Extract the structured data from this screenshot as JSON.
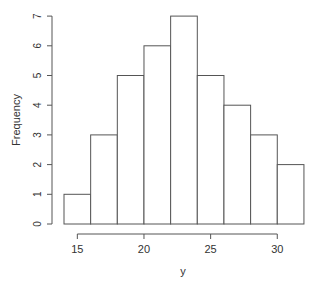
{
  "chart_data": {
    "type": "bar",
    "subtype": "histogram",
    "title": "",
    "xlabel": "y",
    "ylabel": "Frequency",
    "bins": [
      [
        14,
        16
      ],
      [
        16,
        18
      ],
      [
        18,
        20
      ],
      [
        20,
        22
      ],
      [
        22,
        24
      ],
      [
        24,
        26
      ],
      [
        26,
        28
      ],
      [
        28,
        30
      ],
      [
        30,
        32
      ]
    ],
    "categories": [
      "14-16",
      "16-18",
      "18-20",
      "20-22",
      "22-24",
      "24-26",
      "26-28",
      "28-30",
      "30-32"
    ],
    "values": [
      1,
      3,
      5,
      6,
      7,
      5,
      4,
      3,
      2
    ],
    "xticks": [
      15,
      20,
      25,
      30
    ],
    "yticks": [
      0,
      1,
      2,
      3,
      4,
      5,
      6,
      7
    ],
    "xlim": [
      14,
      32
    ],
    "ylim": [
      0,
      7
    ],
    "grid": false,
    "legend": null
  }
}
